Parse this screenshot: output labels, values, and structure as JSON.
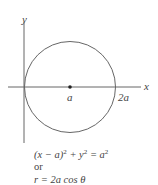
{
  "diagram": {
    "axes": {
      "x_label": "x",
      "y_label": "y"
    },
    "points": {
      "center_label": "a",
      "right_intercept_label": "2a"
    },
    "equations": {
      "cartesian": {
        "lhs_open": "(x − a)",
        "exp1": "2",
        "plus": " + y",
        "exp2": "2",
        "rhs": " = a",
        "exp3": "2"
      },
      "connector": "or",
      "polar": "r = 2a cos θ"
    },
    "colors": {
      "stroke": "#555555",
      "text": "#444444"
    }
  }
}
